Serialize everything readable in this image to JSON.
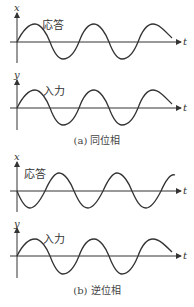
{
  "figure": {
    "panels": [
      {
        "id": "a",
        "caption": "(a) 同位相",
        "plots": [
          {
            "axis_y_label": "x",
            "axis_x_label": "t",
            "wave_label": "応答",
            "phase": "in-phase",
            "start_direction": "up"
          },
          {
            "axis_y_label": "y",
            "axis_x_label": "t",
            "wave_label": "入力",
            "phase": "reference",
            "start_direction": "up"
          }
        ]
      },
      {
        "id": "b",
        "caption": "(b) 逆位相",
        "plots": [
          {
            "axis_y_label": "x",
            "axis_x_label": "t",
            "wave_label": "応答",
            "phase": "anti-phase",
            "start_direction": "down"
          },
          {
            "axis_y_label": "y",
            "axis_x_label": "t",
            "wave_label": "入力",
            "phase": "reference",
            "start_direction": "up"
          }
        ]
      }
    ],
    "colors": {
      "line": "#333333",
      "text": "#333333"
    }
  }
}
